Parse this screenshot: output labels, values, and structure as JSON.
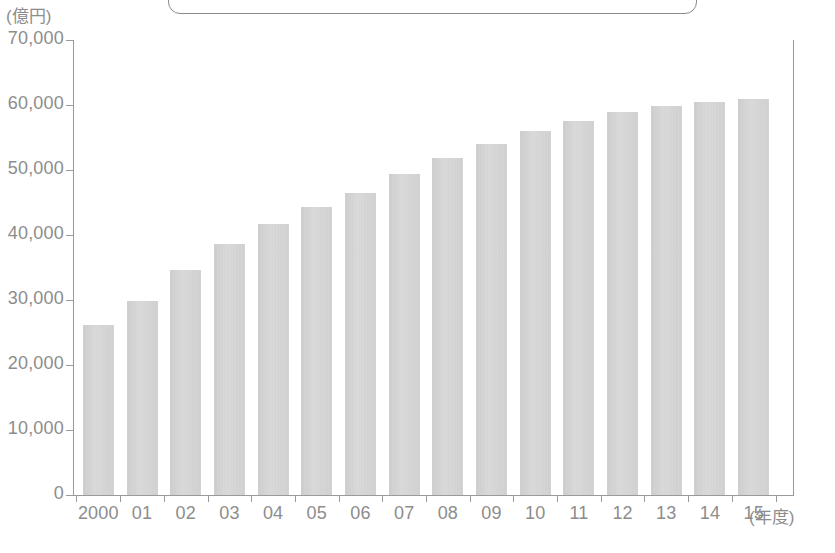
{
  "chart_data": {
    "type": "bar",
    "title": "",
    "subtitle": "",
    "unit_label": "(億円)",
    "xlabel": "(年度)",
    "ylabel": "",
    "ylim": [
      0,
      70000
    ],
    "y_tick_step": 10000,
    "grid": false,
    "legend": null,
    "bar_color": "#cdcdcd",
    "axis_color": "#9a9a9a",
    "text_color": "#8d8d8d",
    "y_ticks": [
      "70,000",
      "60,000",
      "50,000",
      "40,000",
      "30,000",
      "20,000",
      "10,000",
      "0"
    ],
    "y_tick_values": [
      70000,
      60000,
      50000,
      40000,
      30000,
      20000,
      10000,
      0
    ],
    "categories": [
      "2000",
      "01",
      "02",
      "03",
      "04",
      "05",
      "06",
      "07",
      "08",
      "09",
      "10",
      "11",
      "12",
      "13",
      "14",
      "15"
    ],
    "values": [
      26200,
      29900,
      34600,
      38600,
      41700,
      44300,
      46500,
      49400,
      51900,
      54000,
      56000,
      57600,
      59000,
      59800,
      60500,
      61000
    ],
    "series": [
      {
        "name": "",
        "values": [
          26200,
          29900,
          34600,
          38600,
          41700,
          44300,
          46500,
          49400,
          51900,
          54000,
          56000,
          57600,
          59000,
          59800,
          60500,
          61000
        ]
      }
    ]
  },
  "callout": {
    "label": ""
  }
}
